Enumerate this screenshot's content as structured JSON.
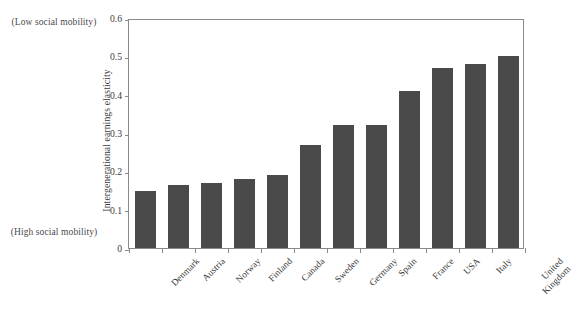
{
  "chart_data": {
    "type": "bar",
    "title": "",
    "subtitle": "",
    "xlabel": "",
    "ylabel": "Intergenerational earnings elasticity",
    "ylim": [
      0,
      0.6
    ],
    "yticks": [
      "0",
      "0.1",
      "0.2",
      "0.3",
      "0.4",
      "0.5",
      "0.6"
    ],
    "ytick_values": [
      0,
      0.1,
      0.2,
      0.3,
      0.4,
      0.5,
      0.6
    ],
    "grid": false,
    "legend": false,
    "legend_position": "none",
    "bar_color": "#4a4a4a",
    "frame_color": "#8a8a8a",
    "categories": [
      "Denmark",
      "Austria",
      "Norway",
      "Finland",
      "Canada",
      "Sweden",
      "Germany",
      "Spain",
      "France",
      "USA",
      "Italy",
      "United\nKingdom"
    ],
    "values": [
      0.15,
      0.165,
      0.17,
      0.18,
      0.19,
      0.27,
      0.32,
      0.32,
      0.41,
      0.47,
      0.48,
      0.5
    ],
    "annotations": [
      {
        "text": "(Low social\nmobility)",
        "position": "top-left"
      },
      {
        "text": "(High social\nmobility)",
        "position": "bottom-left"
      }
    ]
  },
  "annotations": {
    "low_mobility": "(Low social\nmobility)",
    "high_mobility": "(High social\nmobility)"
  }
}
